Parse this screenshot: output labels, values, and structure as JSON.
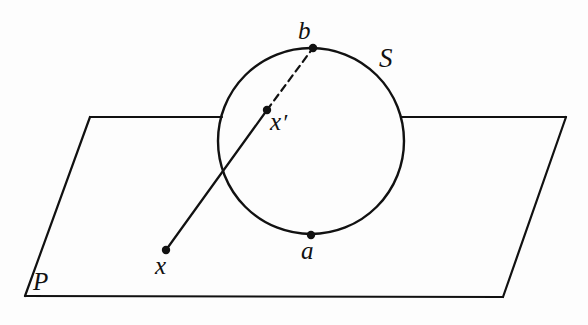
{
  "figure": {
    "background_color": "#fdfdfd",
    "ink_color": "#111111",
    "width": 588,
    "height": 325,
    "labels": {
      "sphere": "S",
      "plane": "P",
      "north_pole": "b",
      "south_pole": "a",
      "plane_point": "x",
      "sphere_point_base": "x",
      "sphere_point_prime": "′",
      "sphere_point": "x′"
    },
    "points": [
      {
        "name": "b",
        "label": "b",
        "x": 313,
        "y": 48,
        "role": "north-pole",
        "marker": "filled-dot"
      },
      {
        "name": "a",
        "label": "a",
        "x": 311,
        "y": 235,
        "role": "south-pole",
        "marker": "filled-dot"
      },
      {
        "name": "x-prime",
        "label": "x′",
        "x": 267,
        "y": 110,
        "role": "sphere-image-point",
        "marker": "filled-dot"
      },
      {
        "name": "x",
        "label": "x",
        "x": 166,
        "y": 250,
        "role": "plane-point",
        "marker": "filled-dot"
      }
    ],
    "circle": {
      "name": "sphere-outline",
      "center_x": 311,
      "center_y": 141,
      "radius": 93,
      "stroke_width": 2.4
    },
    "plane": {
      "name": "plane-parallelogram",
      "vertices": [
        {
          "x": 90,
          "y": 117
        },
        {
          "x": 566,
          "y": 117
        },
        {
          "x": 503,
          "y": 297
        },
        {
          "x": 25,
          "y": 296
        }
      ],
      "top_edge_gap": {
        "start_x": 222,
        "end_x": 401
      },
      "stroke_width": 2.2
    },
    "segments": [
      {
        "name": "ray-x-to-x-prime",
        "style": "solid",
        "from": {
          "x": 166,
          "y": 250
        },
        "to": {
          "x": 267,
          "y": 110
        },
        "stroke_width": 2.2
      },
      {
        "name": "ray-x-prime-to-b",
        "style": "dashed",
        "from": {
          "x": 267,
          "y": 110
        },
        "to": {
          "x": 313,
          "y": 48
        },
        "stroke_width": 2.2,
        "dash_pattern": "7 5"
      }
    ]
  }
}
